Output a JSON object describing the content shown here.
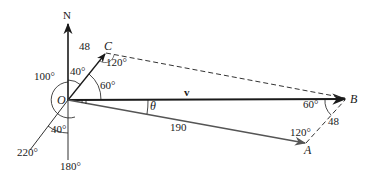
{
  "labels": {
    "north": "N",
    "origin": "O",
    "point_c": "C",
    "point_b": "B",
    "point_a": "A",
    "vector_v": "v",
    "theta": "θ",
    "len_oc": "48",
    "len_ab": "48",
    "len_oa": "190",
    "angle_100": "100°",
    "angle_40_top": "40°",
    "angle_60_o": "60°",
    "angle_120_c": "120°",
    "angle_60_b": "60°",
    "angle_120_a": "120°",
    "angle_40_bottom": "40°",
    "bearing_220": "220°",
    "bearing_180": "180°"
  },
  "colors": {
    "ink": "#1a1a1a",
    "vector_oa": "#555555",
    "dashed": "#333333"
  }
}
